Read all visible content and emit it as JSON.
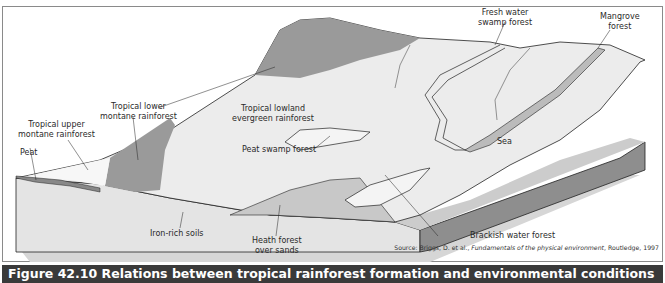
{
  "figure": {
    "caption": "Figure 42.10 Relations between tropical rainforest formation and environmental conditions",
    "source_prefix": "Source: Briggs, D. et al., ",
    "source_title": "Fundamentals of the physical environment",
    "source_suffix": ", Routledge, 1997"
  },
  "labels": {
    "fresh_water": [
      "Fresh water",
      "swamp forest"
    ],
    "mangrove": [
      "Mangrove",
      "forest"
    ],
    "lower_montane": [
      "Tropical lower",
      "montane rainforest"
    ],
    "lowland": [
      "Tropical lowland",
      "evergreen rainforest"
    ],
    "upper_montane": [
      "Tropical upper",
      "montane rainforest"
    ],
    "peat": "Peat",
    "peat_swamp": "Peat swamp forest",
    "sea": "Sea",
    "iron_soils": "Iron-rich soils",
    "heath": [
      "Heath forest",
      "over sands"
    ],
    "brackish": "Brackish water forest"
  },
  "colors": {
    "terrain": "#e9e9e9",
    "dark_zone": "#9a9a9a",
    "block_front": "#dedede",
    "block_side": "#8c8c8c",
    "sea": "#cfcfcf",
    "caption_bg": "#3a3a3a"
  }
}
